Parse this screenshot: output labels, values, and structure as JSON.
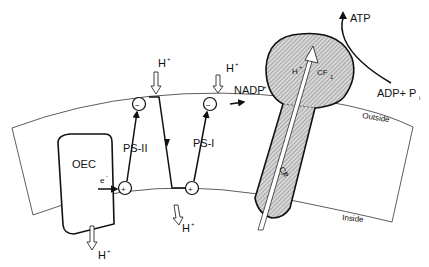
{
  "diagram": {
    "type": "chloroplast thylakoid membrane electron transport and ATP synthase",
    "labels": {
      "oec": "OEC",
      "electron": "e",
      "electron_sup": "-",
      "ps2": "PS-II",
      "ps1": "PS-I",
      "nadp": "NADP",
      "nadp_sup": "+",
      "cf1": "CF",
      "cf1_sub": "1",
      "cf0": "CF",
      "cf0_sub": "0",
      "h_inside_cf": "H",
      "h_inside_cf_sup": "+",
      "atp": "ATP",
      "adp_pi": "ADP+ P",
      "adp_pi_sub": "i",
      "outside": "Outside",
      "inside": "Inside",
      "h_top1": "H",
      "h_top2": "H",
      "h_bottom1": "H",
      "h_bottom2": "H",
      "h_sup": "+",
      "minus": "−",
      "plus": "+"
    },
    "colors": {
      "stroke": "#111111",
      "membrane": "#ffffff",
      "hatch": "#9a9a9a"
    }
  }
}
